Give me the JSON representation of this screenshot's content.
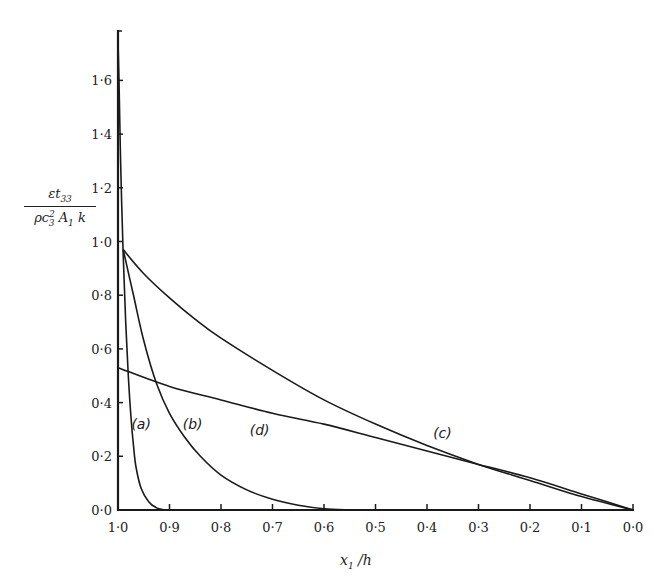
{
  "chart_data": {
    "type": "line",
    "title": "",
    "xlabel": "x_1 / h",
    "ylabel": "εt_33 / (ρc_3^2 A_1 k)",
    "xlim": [
      1.0,
      0.0
    ],
    "ylim": [
      0.0,
      1.75
    ],
    "x_reversed": true,
    "grid": false,
    "legend": "inline curve labels",
    "x_ticks": [
      "1·0",
      "0·9",
      "0·8",
      "0·7",
      "0·6",
      "0·5",
      "0·4",
      "0·3",
      "0·2",
      "0·1",
      "0·0"
    ],
    "y_ticks": [
      "0·0",
      "0·2",
      "0·4",
      "0·6",
      "0·8",
      "1·0",
      "1·2",
      "1·4",
      "1·6"
    ],
    "series": [
      {
        "name": "(a)",
        "x": [
          1.0,
          0.998,
          0.995,
          0.99,
          0.985,
          0.98,
          0.975,
          0.97,
          0.965,
          0.955,
          0.94,
          0.925,
          0.91
        ],
        "y": [
          1.75,
          1.6,
          1.3,
          0.95,
          0.7,
          0.5,
          0.35,
          0.24,
          0.16,
          0.08,
          0.03,
          0.008,
          0.0
        ]
      },
      {
        "name": "(b)",
        "x": [
          0.99,
          0.97,
          0.95,
          0.925,
          0.9,
          0.87,
          0.84,
          0.8,
          0.75,
          0.7,
          0.65,
          0.6,
          0.55
        ],
        "y": [
          0.97,
          0.8,
          0.63,
          0.47,
          0.36,
          0.27,
          0.2,
          0.13,
          0.075,
          0.04,
          0.018,
          0.005,
          0.0
        ]
      },
      {
        "name": "(c)",
        "x": [
          0.99,
          0.95,
          0.9,
          0.85,
          0.8,
          0.7,
          0.6,
          0.5,
          0.4,
          0.3,
          0.2,
          0.1,
          0.0
        ],
        "y": [
          0.97,
          0.88,
          0.79,
          0.71,
          0.64,
          0.52,
          0.41,
          0.32,
          0.24,
          0.17,
          0.11,
          0.05,
          0.0
        ]
      },
      {
        "name": "(d)",
        "x": [
          1.0,
          0.9,
          0.8,
          0.7,
          0.6,
          0.5,
          0.4,
          0.3,
          0.2,
          0.1,
          0.0
        ],
        "y": [
          0.53,
          0.46,
          0.41,
          0.36,
          0.32,
          0.27,
          0.22,
          0.17,
          0.12,
          0.06,
          0.0
        ]
      }
    ],
    "annotations": [
      {
        "text": "(a)",
        "x": 0.955,
        "y": 0.3
      },
      {
        "text": "(b)",
        "x": 0.855,
        "y": 0.3
      },
      {
        "text": "(d)",
        "x": 0.725,
        "y": 0.28
      },
      {
        "text": "(c)",
        "x": 0.37,
        "y": 0.27
      }
    ]
  },
  "labels": {
    "y_num": "εt",
    "y_num_sub": "33",
    "y_den_a": "ρc",
    "y_den_sup": "2",
    "y_den_sub": "3",
    "y_den_b": " A",
    "y_den_sub2": "1",
    "y_den_c": " k",
    "x_main": "x",
    "x_sub": "1",
    "x_rest": " /h"
  }
}
